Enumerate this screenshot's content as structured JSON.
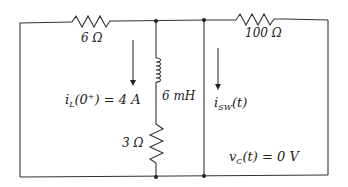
{
  "circuit": {
    "resistor_left": {
      "label": "6 Ω"
    },
    "resistor_right": {
      "label": "100 Ω"
    },
    "resistor_bottom": {
      "label": "3 Ω"
    },
    "inductor": {
      "label": "6 mH"
    },
    "inductor_current": {
      "var": "i",
      "sub": "L",
      "arg_open": "(0",
      "sup": "+",
      "rest": ") = 4 A"
    },
    "switch_current": {
      "var": "i",
      "sub": "SW",
      "rest": "(t)"
    },
    "capacitor_voltage": {
      "var": "v",
      "sub": "C",
      "rest": "(t) = 0 V"
    }
  },
  "colors": {
    "wire": "#333333",
    "text": "#222222",
    "background": "#ffffff"
  }
}
